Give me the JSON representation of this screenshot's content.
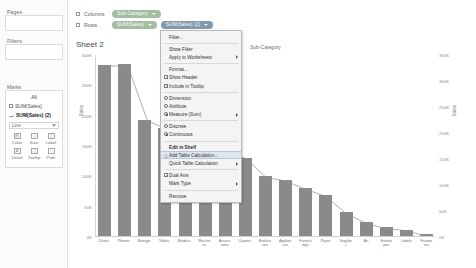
{
  "app": {
    "name": "Tableau Desktop"
  },
  "sidebar": {
    "pages_label": "Pages",
    "filters_label": "Filters",
    "marks_label": "Marks",
    "marks_card": {
      "header": "All",
      "items": [
        {
          "icon": "bar-mark-icon",
          "label": "SUM(Sales)"
        },
        {
          "icon": "line-mark-icon",
          "label": "SUM(Sales) (2)"
        }
      ],
      "mark_type": "Line",
      "buttons": [
        {
          "icon": "color-icon",
          "label": "Color"
        },
        {
          "icon": "size-icon",
          "label": "Size"
        },
        {
          "icon": "label-icon",
          "label": "Label"
        },
        {
          "icon": "detail-icon",
          "label": "Detail"
        },
        {
          "icon": "tooltip-icon",
          "label": "Tooltip"
        },
        {
          "icon": "path-icon",
          "label": "Path"
        }
      ]
    }
  },
  "shelves": {
    "columns_label": "Columns",
    "rows_label": "Rows",
    "columns_pills": [
      {
        "text": "Sub-Category",
        "color": "green"
      }
    ],
    "rows_pills": [
      {
        "text": "SUM(Sales)",
        "color": "green"
      },
      {
        "text": "SUM(Sales) (2)",
        "color": "selected"
      }
    ]
  },
  "worksheet": {
    "title": "Sheet 2",
    "column_header": "Sub-Category",
    "y_left_title": "Sales",
    "y_right_title": "Sales",
    "y_left_ticks": [
      "300K",
      "250K",
      "200K",
      "150K",
      "100K",
      "50K",
      "0K"
    ],
    "y_right_ticks": [
      "350K",
      "300K",
      "250K",
      "200K",
      "150K",
      "100K",
      "50K",
      "0K"
    ]
  },
  "chart_data": {
    "type": "bar",
    "title": "Sheet 2",
    "xlabel": "Sub-Category",
    "ylabel": "Sales",
    "ylim": [
      0,
      350000
    ],
    "grid": false,
    "legend": "none",
    "categories": [
      "Chairs",
      "Phones",
      "Storage",
      "Tables",
      "Binders",
      "Machines",
      "Accessories",
      "Copiers",
      "Bookcases",
      "Appliances",
      "Furnishings",
      "Paper",
      "Supplies",
      "Art",
      "Envelopes",
      "Labels",
      "Fasteners"
    ],
    "series": [
      {
        "name": "SUM(Sales)",
        "type": "bar",
        "values": [
          328449,
          330007,
          223844,
          206966,
          203413,
          189239,
          167380,
          149528,
          114880,
          107532,
          91705,
          78479,
          46674,
          27119,
          16476,
          12486,
          3024
        ]
      },
      {
        "name": "SUM(Sales) (2)",
        "type": "line",
        "values": [
          328449,
          330007,
          223844,
          206966,
          203413,
          189239,
          167380,
          149528,
          114880,
          107532,
          91705,
          78479,
          46674,
          27119,
          16476,
          12486,
          3024
        ]
      }
    ]
  },
  "context_menu": {
    "items": [
      {
        "id": "filter",
        "label": "Filter...",
        "type": "plain"
      },
      {
        "id": "separator-1",
        "type": "separator"
      },
      {
        "id": "show-filter",
        "label": "Show Filter",
        "type": "plain"
      },
      {
        "id": "apply-to-worksheets",
        "label": "Apply to Worksheets",
        "type": "submenu"
      },
      {
        "id": "separator-2",
        "type": "separator"
      },
      {
        "id": "format",
        "label": "Format...",
        "type": "plain"
      },
      {
        "id": "show-header",
        "label": "Show Header",
        "type": "check",
        "checked": true
      },
      {
        "id": "include-in-tooltip",
        "label": "Include in Tooltip",
        "type": "check",
        "checked": true
      },
      {
        "id": "separator-3",
        "type": "separator"
      },
      {
        "id": "dimension",
        "label": "Dimension",
        "type": "radio",
        "selected": false
      },
      {
        "id": "attribute",
        "label": "Attribute",
        "type": "radio",
        "selected": false
      },
      {
        "id": "measure-sum",
        "label": "Measure (Sum)",
        "type": "radio-submenu",
        "selected": true
      },
      {
        "id": "separator-4",
        "type": "separator"
      },
      {
        "id": "discrete",
        "label": "Discrete",
        "type": "radio",
        "selected": false
      },
      {
        "id": "continuous",
        "label": "Continuous",
        "type": "radio",
        "selected": true
      },
      {
        "id": "separator-5",
        "type": "separator"
      },
      {
        "id": "edit-in-shelf",
        "label": "Edit in Shelf",
        "type": "bold"
      },
      {
        "id": "add-table-calculation",
        "label": "Add Table Calculation...",
        "type": "highlight",
        "icon": "table-calc-icon"
      },
      {
        "id": "quick-table-calculation",
        "label": "Quick Table Calculation",
        "type": "submenu"
      },
      {
        "id": "separator-6",
        "type": "separator"
      },
      {
        "id": "dual-axis",
        "label": "Dual Axis",
        "type": "check",
        "checked": true
      },
      {
        "id": "mark-type",
        "label": "Mark Type",
        "type": "submenu"
      },
      {
        "id": "separator-7",
        "type": "separator"
      },
      {
        "id": "remove",
        "label": "Remove",
        "type": "plain"
      }
    ]
  }
}
